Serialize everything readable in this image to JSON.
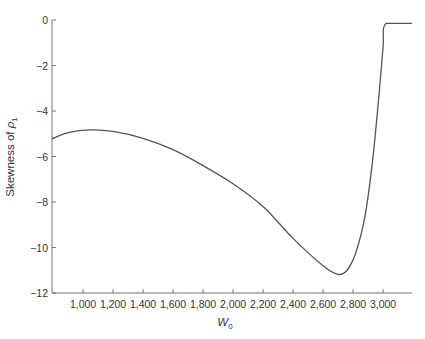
{
  "chart_data": {
    "type": "line",
    "title": "",
    "xlabel": "W",
    "xlabel_sub": "0",
    "ylabel": "Skewness of ",
    "ylabel_sym": "ρ",
    "ylabel_sub": "1",
    "xlim": [
      793,
      3193
    ],
    "ylim": [
      -12,
      0
    ],
    "grid": false,
    "legend": null,
    "x_ticks": [
      1000,
      1200,
      1400,
      1600,
      1800,
      2000,
      2200,
      2400,
      2600,
      2800,
      3000
    ],
    "x_tick_labels": [
      "1,000",
      "1,200",
      "1,400",
      "1,600",
      "1,800",
      "2,000",
      "2,200",
      "2,400",
      "2,600",
      "2,800",
      "3,000"
    ],
    "y_ticks": [
      0,
      -2,
      -4,
      -6,
      -8,
      -10,
      -12
    ],
    "y_tick_labels": [
      "0",
      "−2",
      "−4",
      "−6",
      "−8",
      "−10",
      "−12"
    ],
    "series": [
      {
        "name": "Skewness of rho1",
        "color": "#555555",
        "x": [
          793,
          900,
          1050,
          1200,
          1400,
          1600,
          1800,
          2000,
          2200,
          2400,
          2600,
          2700,
          2760,
          2820,
          2880,
          2930,
          2970,
          3000,
          3020,
          3193
        ],
        "values": [
          -5.23,
          -4.95,
          -4.83,
          -4.9,
          -5.2,
          -5.7,
          -6.4,
          -7.2,
          -8.2,
          -9.6,
          -10.8,
          -11.18,
          -11.0,
          -10.2,
          -8.6,
          -6.2,
          -3.5,
          -1.2,
          -0.15,
          -0.15
        ]
      }
    ]
  }
}
